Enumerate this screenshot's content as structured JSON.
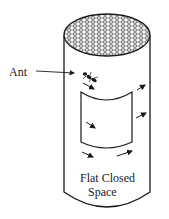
{
  "figure": {
    "labels": {
      "ant": "Ant",
      "space_line1": "Flat Closed",
      "space_line2": "Space"
    },
    "colors": {
      "stroke": "#1a1a1a",
      "background": "#ffffff"
    }
  }
}
